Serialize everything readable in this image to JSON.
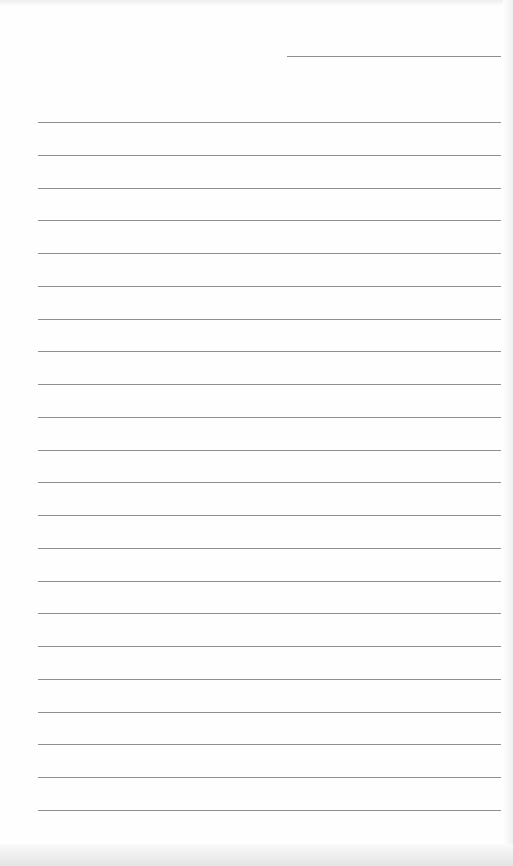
{
  "document": {
    "type": "lined-paper",
    "header_line": {
      "x": 287,
      "y": 56,
      "width": 214
    },
    "ruled_lines": {
      "count": 22,
      "first_y": 122,
      "spacing": 32.76,
      "x": 38,
      "width": 463
    },
    "line_color": "#8f8f8f",
    "paper_color": "#fefefe"
  }
}
